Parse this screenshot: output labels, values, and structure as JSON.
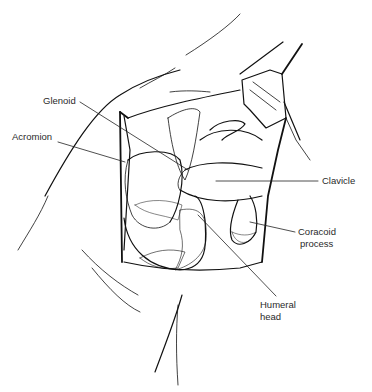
{
  "figure": {
    "type": "anatomical-line-drawing",
    "stroke_color": "#111111",
    "background": "#ffffff"
  },
  "labels": {
    "glenoid": "Glenoid",
    "acromion": "Acromion",
    "clavicle": "Clavicle",
    "coracoid_line1": "Coracoid",
    "coracoid_line2": "process",
    "humeral_line1": "Humeral",
    "humeral_line2": "head"
  }
}
